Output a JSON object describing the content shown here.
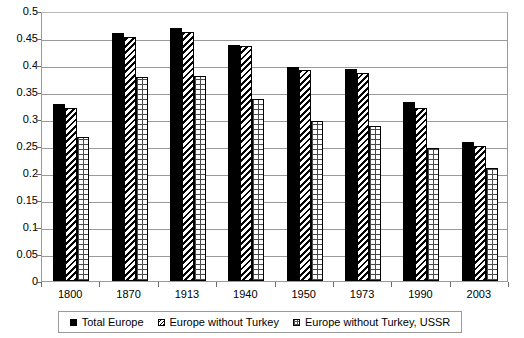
{
  "chart_data": {
    "type": "bar",
    "title": "",
    "subtitle": "",
    "xlabel": "",
    "ylabel": "",
    "categories": [
      "1800",
      "1870",
      "1913",
      "1940",
      "1950",
      "1973",
      "1990",
      "2003"
    ],
    "series": [
      {
        "name": "Total Europe",
        "pattern": "solid-black",
        "values": [
          0.328,
          0.459,
          0.468,
          0.437,
          0.396,
          0.392,
          0.331,
          0.257
        ]
      },
      {
        "name": "Europe without Turkey",
        "pattern": "diagonal-stripes",
        "values": [
          0.32,
          0.452,
          0.461,
          0.436,
          0.39,
          0.385,
          0.321,
          0.25
        ]
      },
      {
        "name": "Europe without Turkey, USSR",
        "pattern": "crosshatch-grid",
        "values": [
          0.266,
          0.377,
          0.379,
          0.337,
          0.296,
          0.287,
          0.246,
          0.21
        ]
      }
    ],
    "ylim": [
      0,
      0.5
    ],
    "yticks": [
      "0",
      "0.05",
      "0.1",
      "0.15",
      "0.2",
      "0.25",
      "0.3",
      "0.35",
      "0.4",
      "0.45",
      "0.5"
    ],
    "ytick_values": [
      0,
      0.05,
      0.1,
      0.15,
      0.2,
      0.25,
      0.3,
      0.35,
      0.4,
      0.45,
      0.5
    ],
    "grid": true,
    "grid_axis": "y",
    "legend_position": "bottom",
    "colors": {
      "axis": "#9a9a9a",
      "grid": "#9a9a9a",
      "bar_solid": "#000000",
      "text": "#000000",
      "background": "#ffffff"
    }
  },
  "legend": {
    "items": [
      {
        "label": "Total Europe",
        "swatch": "solid-black-swatch"
      },
      {
        "label": "Europe without Turkey",
        "swatch": "diagonal-stripe-swatch"
      },
      {
        "label": "Europe without Turkey, USSR",
        "swatch": "crosshatch-swatch"
      }
    ]
  }
}
